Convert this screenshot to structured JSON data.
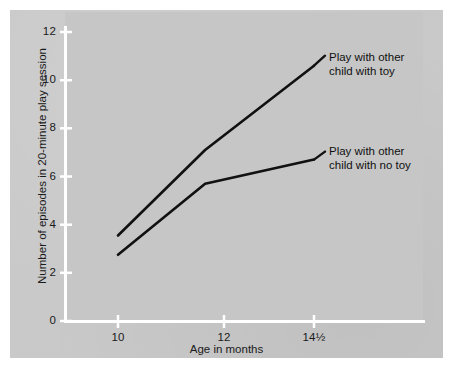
{
  "figure": {
    "background_color": "#c9c9c9",
    "plot_background_color": "#c6c6c6",
    "axis_color": "#ffffff",
    "line_color": "#111111"
  },
  "axes": {
    "y_title": "Number of episodes in 20-minute play session",
    "x_title": "Age in months",
    "y_ticks": [
      "0",
      "2",
      "4",
      "6",
      "8",
      "10",
      "12"
    ],
    "x_ticks": [
      "10",
      "12",
      "14½"
    ]
  },
  "annotations": {
    "toy": {
      "line1": "Play with other",
      "line2": "child with toy"
    },
    "no_toy": {
      "line1": "Play with other",
      "line2": "child with no toy"
    }
  },
  "chart_data": {
    "type": "line",
    "title": "",
    "xlabel": "Age in months",
    "ylabel": "Number of episodes in 20-minute play session",
    "x": [
      10,
      12,
      14.5
    ],
    "x_tick_labels": [
      "10",
      "12",
      "14½"
    ],
    "xlim": [
      10,
      14.5
    ],
    "ylim": [
      0,
      12
    ],
    "y_ticks": [
      0,
      2,
      4,
      6,
      8,
      10,
      12
    ],
    "grid": false,
    "legend_position": "inline-annotations",
    "series": [
      {
        "name": "Play with other child with toy",
        "values": [
          3.55,
          7.1,
          10.6
        ]
      },
      {
        "name": "Play with other child with no toy",
        "values": [
          2.75,
          5.7,
          6.7
        ]
      }
    ]
  }
}
